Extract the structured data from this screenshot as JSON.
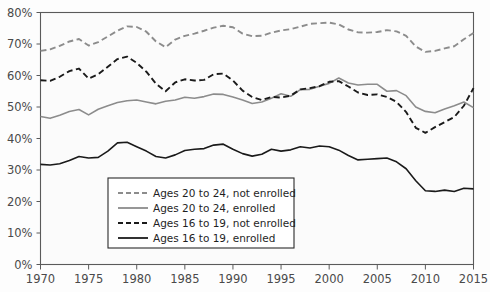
{
  "chart_data": {
    "type": "line",
    "title": "",
    "subtitle": "",
    "xlabel": "",
    "ylabel": "",
    "xlim": [
      1970,
      2015
    ],
    "ylim": [
      0,
      80
    ],
    "grid": false,
    "legend_position": "bottom-left",
    "x_tick_labels": [
      "1970",
      "1975",
      "1980",
      "1985",
      "1990",
      "1995",
      "2000",
      "2005",
      "2010",
      "2015"
    ],
    "x_ticks": [
      1970,
      1975,
      1980,
      1985,
      1990,
      1995,
      2000,
      2005,
      2010,
      2015
    ],
    "y_tick_labels": [
      "0%",
      "10%",
      "20%",
      "30%",
      "40%",
      "50%",
      "60%",
      "70%",
      "80%"
    ],
    "y_ticks": [
      0,
      10,
      20,
      30,
      40,
      50,
      60,
      70,
      80
    ],
    "x": [
      1970,
      1971,
      1972,
      1973,
      1974,
      1975,
      1976,
      1977,
      1978,
      1979,
      1980,
      1981,
      1982,
      1983,
      1984,
      1985,
      1986,
      1987,
      1988,
      1989,
      1990,
      1991,
      1992,
      1993,
      1994,
      1995,
      1996,
      1997,
      1998,
      1999,
      2000,
      2001,
      2002,
      2003,
      2004,
      2005,
      2006,
      2007,
      2008,
      2009,
      2010,
      2011,
      2012,
      2013,
      2014,
      2015
    ],
    "series": [
      {
        "name": "Ages 20 to 24, not enrolled",
        "color": "#8c8c8c",
        "style": "dashed",
        "values": [
          67.8,
          68.3,
          69.4,
          70.8,
          71.6,
          69.5,
          70.6,
          72.4,
          74.2,
          75.6,
          75.4,
          73.9,
          70.8,
          69.0,
          71.4,
          72.6,
          73.3,
          74.2,
          75.2,
          75.8,
          75.3,
          73.3,
          72.5,
          72.6,
          73.6,
          74.3,
          74.7,
          75.5,
          76.4,
          76.6,
          76.8,
          76.2,
          74.6,
          73.7,
          73.6,
          73.8,
          74.4,
          74.0,
          72.6,
          69.2,
          67.5,
          67.8,
          68.6,
          69.3,
          71.5,
          73.5
        ]
      },
      {
        "name": "Ages 20 to 24, enrolled",
        "color": "#8c8c8c",
        "style": "solid",
        "values": [
          47.0,
          46.4,
          47.4,
          48.6,
          49.2,
          47.5,
          49.3,
          50.4,
          51.4,
          52.0,
          52.2,
          51.6,
          51.0,
          51.8,
          52.2,
          53.1,
          52.8,
          53.3,
          54.1,
          54.0,
          53.2,
          52.2,
          51.1,
          51.6,
          52.8,
          54.2,
          53.4,
          55.5,
          55.6,
          56.6,
          57.5,
          59.2,
          57.6,
          57.0,
          57.2,
          57.2,
          55.0,
          55.2,
          53.6,
          50.0,
          48.6,
          48.2,
          49.4,
          50.4,
          51.6,
          49.8
        ]
      },
      {
        "name": "Ages 16 to 19, not enrolled",
        "color": "#1a1a1a",
        "style": "dashed",
        "values": [
          58.5,
          58.3,
          59.6,
          61.4,
          62.2,
          59.0,
          60.4,
          62.8,
          65.2,
          66.0,
          64.0,
          61.2,
          57.4,
          55.0,
          57.8,
          58.8,
          58.4,
          58.6,
          60.4,
          60.6,
          58.4,
          55.2,
          53.2,
          52.2,
          53.2,
          53.0,
          53.6,
          55.6,
          56.0,
          56.6,
          58.0,
          58.2,
          56.5,
          54.6,
          53.8,
          54.0,
          53.2,
          51.6,
          48.4,
          43.4,
          41.8,
          43.6,
          45.2,
          46.8,
          50.4,
          56.0
        ]
      },
      {
        "name": "Ages 16 to 19, enrolled",
        "color": "#1a1a1a",
        "style": "solid",
        "values": [
          31.8,
          31.6,
          32.0,
          33.0,
          34.3,
          33.8,
          34.0,
          36.0,
          38.6,
          38.8,
          37.4,
          36.0,
          34.3,
          33.8,
          34.8,
          36.2,
          36.6,
          36.8,
          37.9,
          38.2,
          36.6,
          35.2,
          34.4,
          35.0,
          36.6,
          36.0,
          36.4,
          37.4,
          37.0,
          37.6,
          37.4,
          36.3,
          34.6,
          33.2,
          33.4,
          33.6,
          33.8,
          32.6,
          30.4,
          26.6,
          23.4,
          23.2,
          23.6,
          23.2,
          24.2,
          24.0
        ]
      }
    ]
  },
  "legend": {
    "items": [
      {
        "label": "Ages 20 to 24, not enrolled"
      },
      {
        "label": "Ages 20 to 24, enrolled"
      },
      {
        "label": "Ages 16 to 19, not enrolled"
      },
      {
        "label": "Ages 16 to 19, enrolled"
      }
    ]
  }
}
